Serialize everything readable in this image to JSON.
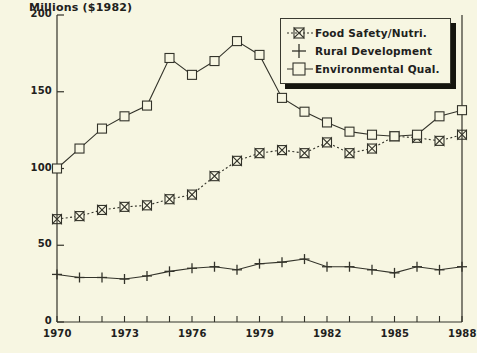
{
  "chart_data": {
    "type": "line",
    "title": "Millions ($1982)",
    "xlabel": "",
    "ylabel": "Millions ($1982)",
    "xlim": [
      1970,
      1988
    ],
    "ylim": [
      0,
      200
    ],
    "yticks": [
      0,
      50,
      100,
      150,
      200
    ],
    "ytick_labels": [
      "0",
      "50",
      "100",
      "150",
      "200"
    ],
    "xticks": [
      1970,
      1971,
      1972,
      1973,
      1974,
      1975,
      1976,
      1977,
      1978,
      1979,
      1980,
      1981,
      1982,
      1983,
      1984,
      1985,
      1986,
      1987,
      1988
    ],
    "xtick_labels": [
      "1970",
      "1973",
      "1976",
      "1979",
      "1982",
      "1985",
      "1988"
    ],
    "labeled_xticks": [
      1970,
      1973,
      1976,
      1979,
      1982,
      1985,
      1988
    ],
    "grid": false,
    "legend_position": "top-right",
    "x": [
      1970,
      1971,
      1972,
      1973,
      1974,
      1975,
      1976,
      1977,
      1978,
      1979,
      1980,
      1981,
      1982,
      1983,
      1984,
      1985,
      1986,
      1987,
      1988
    ],
    "series": [
      {
        "name": "Food Safety/Nutri.",
        "marker": "bowtie",
        "line_style": "dotted",
        "color": "#33332a",
        "values": [
          67,
          69,
          73,
          75,
          76,
          80,
          83,
          95,
          105,
          110,
          112,
          110,
          117,
          110,
          113,
          121,
          120,
          118,
          122
        ]
      },
      {
        "name": "Rural Development",
        "marker": "plus",
        "line_style": "solid",
        "color": "#33332a",
        "values": [
          31,
          29,
          29,
          28,
          30,
          33,
          35,
          36,
          34,
          38,
          39,
          41,
          36,
          36,
          34,
          32,
          36,
          34,
          36
        ]
      },
      {
        "name": "Environmental Qual.",
        "marker": "square",
        "line_style": "solid",
        "color": "#33332a",
        "values": [
          100,
          113,
          126,
          134,
          141,
          172,
          161,
          170,
          183,
          174,
          146,
          137,
          130,
          124,
          122,
          121,
          122,
          134,
          138
        ]
      }
    ]
  },
  "legend": {
    "items": [
      {
        "label": "Food Safety/Nutri.",
        "marker": "bowtie"
      },
      {
        "label": "Rural Development",
        "marker": "plus"
      },
      {
        "label": "Environmental Qual.",
        "marker": "square"
      }
    ]
  },
  "colors": {
    "background": "#f7f6e2",
    "ink": "#33332a",
    "legend_shadow": "#16160f"
  }
}
